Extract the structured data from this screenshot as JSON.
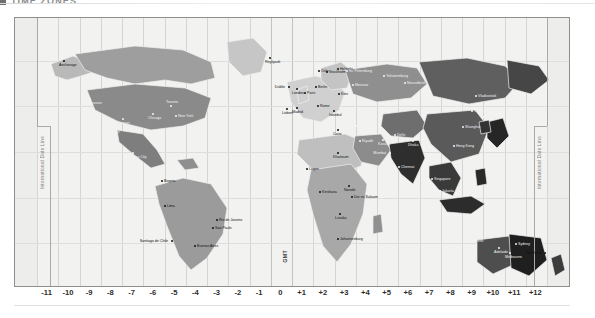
{
  "page": {
    "header": {
      "marker_icon": "square-bullet-icon",
      "title": "TIME ZONES"
    }
  },
  "map": {
    "name": "world-time-zones-map",
    "projection_label": "GMT",
    "date_line_label": "International Date Line",
    "background_color": "#f2f2f0",
    "border_color": "#8e8e8e",
    "band_colors": [
      "#e8e8e6",
      "#bdbdbd",
      "#9a9a9a",
      "#c9c9c9",
      "#7f7f7f",
      "#ababab",
      "#8d8d8d",
      "#d2d2d2",
      "#9f9f9f",
      "#7a7a7a",
      "#bfbfbf",
      "#8a8a8a",
      "#6d6d6d",
      "#a4a4a4",
      "#808080",
      "#5c5c5c",
      "#949494",
      "#6a6a6a",
      "#3f3f3f",
      "#7d7d7d",
      "#555555",
      "#2a2a2a",
      "#6f6f6f",
      "#4a4a4a"
    ]
  },
  "axis": {
    "name": "utc-offset-axis",
    "ticks": [
      "-11",
      "-10",
      "-9",
      "-8",
      "-7",
      "-6",
      "-5",
      "-4",
      "-3",
      "-2",
      "-1",
      "0",
      "+1",
      "+2",
      "+3",
      "+4",
      "+5",
      "+6",
      "+7",
      "+8",
      "+9",
      "+10",
      "+11",
      "+12"
    ]
  },
  "cities": [
    {
      "name": "Anchorage",
      "x": 62,
      "y": 60,
      "side": "b",
      "dark": false
    },
    {
      "name": "Vancouver",
      "x": 88,
      "y": 98,
      "side": "b",
      "dark": true
    },
    {
      "name": "Los Angeles",
      "x": 96,
      "y": 131,
      "side": "r",
      "dark": true
    },
    {
      "name": "Denver",
      "x": 121,
      "y": 118,
      "side": "b",
      "dark": true
    },
    {
      "name": "Chicago",
      "x": 151,
      "y": 113,
      "side": "b",
      "dark": true
    },
    {
      "name": "Mexico City",
      "x": 131,
      "y": 152,
      "side": "b",
      "dark": true
    },
    {
      "name": "New York",
      "x": 174,
      "y": 115,
      "side": "r",
      "dark": true
    },
    {
      "name": "Toronto",
      "x": 169,
      "y": 105,
      "side": "t",
      "dark": true
    },
    {
      "name": "Bogota",
      "x": 160,
      "y": 180,
      "side": "r",
      "dark": false
    },
    {
      "name": "Lima",
      "x": 163,
      "y": 205,
      "side": "r",
      "dark": false
    },
    {
      "name": "Santiago de Chile",
      "x": 170,
      "y": 240,
      "side": "l",
      "dark": false
    },
    {
      "name": "Buenos Aires",
      "x": 193,
      "y": 245,
      "side": "r",
      "dark": false
    },
    {
      "name": "Sao Paulo",
      "x": 211,
      "y": 227,
      "side": "r",
      "dark": false
    },
    {
      "name": "Rio de Janeiro",
      "x": 215,
      "y": 219,
      "side": "r",
      "dark": false
    },
    {
      "name": "Reykjavik",
      "x": 268,
      "y": 57,
      "side": "b",
      "dark": false
    },
    {
      "name": "Dublin",
      "x": 287,
      "y": 86,
      "side": "l",
      "dark": false
    },
    {
      "name": "London",
      "x": 295,
      "y": 88,
      "side": "b",
      "dark": false
    },
    {
      "name": "Lisbon",
      "x": 285,
      "y": 108,
      "side": "b",
      "dark": false
    },
    {
      "name": "Madrid",
      "x": 295,
      "y": 107,
      "side": "b",
      "dark": false
    },
    {
      "name": "Paris",
      "x": 303,
      "y": 92,
      "side": "r",
      "dark": false
    },
    {
      "name": "Oslo",
      "x": 317,
      "y": 70,
      "side": "r",
      "dark": false
    },
    {
      "name": "Stockholm",
      "x": 325,
      "y": 71,
      "side": "r",
      "dark": false
    },
    {
      "name": "Berlin",
      "x": 314,
      "y": 86,
      "side": "r",
      "dark": false
    },
    {
      "name": "Rome",
      "x": 316,
      "y": 105,
      "side": "r",
      "dark": false
    },
    {
      "name": "Helsinki",
      "x": 336,
      "y": 68,
      "side": "r",
      "dark": false
    },
    {
      "name": "St. Petersburg",
      "x": 345,
      "y": 70,
      "side": "r",
      "dark": true
    },
    {
      "name": "Moscow",
      "x": 351,
      "y": 84,
      "side": "r",
      "dark": true
    },
    {
      "name": "Kiev",
      "x": 337,
      "y": 93,
      "side": "r",
      "dark": false
    },
    {
      "name": "Istanbul",
      "x": 332,
      "y": 110,
      "side": "b",
      "dark": false
    },
    {
      "name": "Cairo",
      "x": 336,
      "y": 129,
      "side": "b",
      "dark": false
    },
    {
      "name": "Baghdad",
      "x": 354,
      "y": 125,
      "side": "r",
      "dark": true
    },
    {
      "name": "Riyadh",
      "x": 358,
      "y": 140,
      "side": "r",
      "dark": true
    },
    {
      "name": "Tehran",
      "x": 362,
      "y": 120,
      "side": "r",
      "dark": true
    },
    {
      "name": "Yekaterinburg",
      "x": 382,
      "y": 75,
      "side": "r",
      "dark": true
    },
    {
      "name": "Novosibirsk",
      "x": 403,
      "y": 82,
      "side": "r",
      "dark": true
    },
    {
      "name": "Tashkent",
      "x": 381,
      "y": 107,
      "side": "r",
      "dark": true
    },
    {
      "name": "Karachi",
      "x": 381,
      "y": 139,
      "side": "b",
      "dark": true
    },
    {
      "name": "Delhi",
      "x": 393,
      "y": 134,
      "side": "r",
      "dark": true
    },
    {
      "name": "Mumbai",
      "x": 388,
      "y": 152,
      "side": "l",
      "dark": true
    },
    {
      "name": "Chennai",
      "x": 397,
      "y": 166,
      "side": "r",
      "dark": true
    },
    {
      "name": "Kolkata",
      "x": 406,
      "y": 139,
      "side": "r",
      "dark": true
    },
    {
      "name": "Dhaka",
      "x": 411,
      "y": 140,
      "side": "b",
      "dark": true
    },
    {
      "name": "Bangkok",
      "x": 424,
      "y": 160,
      "side": "r",
      "dark": true
    },
    {
      "name": "Jakarta",
      "x": 438,
      "y": 190,
      "side": "r",
      "dark": true
    },
    {
      "name": "Singapore",
      "x": 430,
      "y": 178,
      "side": "r",
      "dark": true
    },
    {
      "name": "Beijing",
      "x": 452,
      "y": 107,
      "side": "r",
      "dark": true
    },
    {
      "name": "Shanghai",
      "x": 461,
      "y": 126,
      "side": "r",
      "dark": true
    },
    {
      "name": "Hong Kong",
      "x": 452,
      "y": 145,
      "side": "r",
      "dark": true
    },
    {
      "name": "Manila",
      "x": 465,
      "y": 160,
      "side": "r",
      "dark": true
    },
    {
      "name": "Seoul",
      "x": 470,
      "y": 110,
      "side": "r",
      "dark": true
    },
    {
      "name": "Tokyo",
      "x": 482,
      "y": 116,
      "side": "r",
      "dark": true
    },
    {
      "name": "Vladivostok",
      "x": 474,
      "y": 95,
      "side": "r",
      "dark": true
    },
    {
      "name": "Lagos",
      "x": 305,
      "y": 168,
      "side": "r",
      "dark": false
    },
    {
      "name": "Khartoum",
      "x": 336,
      "y": 152,
      "side": "b",
      "dark": false
    },
    {
      "name": "Kinshasa",
      "x": 318,
      "y": 191,
      "side": "r",
      "dark": false
    },
    {
      "name": "Nairobi",
      "x": 347,
      "y": 185,
      "side": "b",
      "dark": false
    },
    {
      "name": "Dar es Salaam",
      "x": 350,
      "y": 196,
      "side": "r",
      "dark": false
    },
    {
      "name": "Lusaka",
      "x": 338,
      "y": 213,
      "side": "b",
      "dark": false
    },
    {
      "name": "Johannesburg",
      "x": 336,
      "y": 238,
      "side": "r",
      "dark": false
    },
    {
      "name": "Perth",
      "x": 471,
      "y": 240,
      "side": "r",
      "dark": true
    },
    {
      "name": "Adelaide",
      "x": 497,
      "y": 247,
      "side": "b",
      "dark": true
    },
    {
      "name": "Melbourne",
      "x": 508,
      "y": 252,
      "side": "b",
      "dark": true
    },
    {
      "name": "Sydney",
      "x": 514,
      "y": 243,
      "side": "r",
      "dark": true
    },
    {
      "name": "Auckland",
      "x": 543,
      "y": 252,
      "side": "l",
      "dark": false
    }
  ]
}
